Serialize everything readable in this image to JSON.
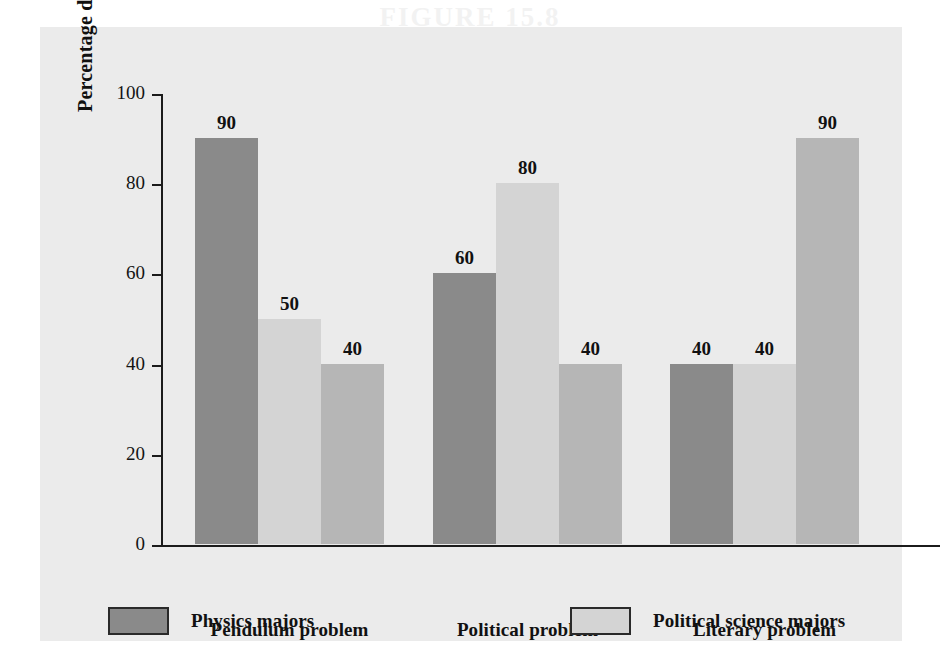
{
  "chart_data": {
    "type": "bar",
    "title": "",
    "xlabel": "",
    "ylabel": "Percentage displaying formal thought",
    "ylim": [
      0,
      100
    ],
    "yticks": [
      0,
      20,
      40,
      60,
      80,
      100
    ],
    "grid": false,
    "legend_position": "bottom",
    "categories": [
      "Pendulum problem",
      "Political problem",
      "Literary problem"
    ],
    "series": [
      {
        "name": "Physics majors",
        "color": "#8a8a8a",
        "values": [
          90,
          60,
          40
        ]
      },
      {
        "name": "Political science majors",
        "color": "#d4d4d4",
        "values": [
          50,
          80,
          40
        ]
      },
      {
        "name": "English majors",
        "color": "#b6b6b6",
        "values": [
          40,
          40,
          90
        ]
      }
    ]
  },
  "axis": {
    "y_title": "Percentage displaying formal thought",
    "y_ticks": [
      {
        "label": "100",
        "value": 100
      },
      {
        "label": "80",
        "value": 80
      },
      {
        "label": "60",
        "value": 60
      },
      {
        "label": "40",
        "value": 40
      },
      {
        "label": "20",
        "value": 20
      },
      {
        "label": "0",
        "value": 0
      }
    ]
  },
  "categories": [
    {
      "label": "Pendulum problem"
    },
    {
      "label": "Political problem"
    },
    {
      "label": "Literary problem"
    }
  ],
  "bars": [
    {
      "group": 0,
      "series": 0,
      "value": 90,
      "label": "90",
      "color": "#8a8a8a"
    },
    {
      "group": 0,
      "series": 1,
      "value": 50,
      "label": "50",
      "color": "#d4d4d4"
    },
    {
      "group": 0,
      "series": 2,
      "value": 40,
      "label": "40",
      "color": "#b6b6b6"
    },
    {
      "group": 1,
      "series": 0,
      "value": 60,
      "label": "60",
      "color": "#8a8a8a"
    },
    {
      "group": 1,
      "series": 1,
      "value": 80,
      "label": "80",
      "color": "#d4d4d4"
    },
    {
      "group": 1,
      "series": 2,
      "value": 40,
      "label": "40",
      "color": "#b6b6b6"
    },
    {
      "group": 2,
      "series": 0,
      "value": 40,
      "label": "40",
      "color": "#8a8a8a"
    },
    {
      "group": 2,
      "series": 1,
      "value": 40,
      "label": "40",
      "color": "#d4d4d4"
    },
    {
      "group": 2,
      "series": 2,
      "value": 90,
      "label": "90",
      "color": "#b6b6b6"
    }
  ],
  "legend": {
    "entries": [
      {
        "label": "Physics majors",
        "color": "#8a8a8a"
      },
      {
        "label": "Political science majors",
        "color": "#d4d4d4"
      },
      {
        "label": "English majors",
        "color": "#b6b6b6"
      }
    ]
  },
  "colors": {
    "panel_background": "#ebebeb",
    "page_background": "#ffffff",
    "axis": "#1b1b1b",
    "text": "#111111",
    "physics": "#8a8a8a",
    "political_science": "#d4d4d4",
    "english": "#b6b6b6"
  },
  "bleedthrough_text": "FIGURE 15.8"
}
